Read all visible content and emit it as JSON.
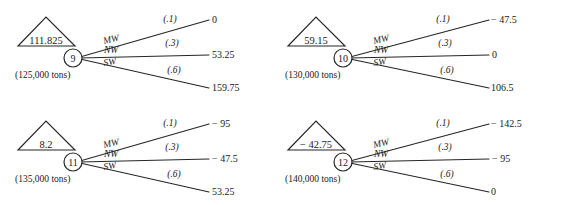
{
  "figure": {
    "type": "decision-tree-fragment",
    "panel_count": 4,
    "line_color": "#262626",
    "text_color": "#1a1a1a",
    "background_color": "#ffffff"
  },
  "panels": [
    {
      "id": "panel-9",
      "node_number": "9",
      "triangle_value": "111.825",
      "tons_label": "(125,000 tons)",
      "branches": [
        {
          "label": "MW",
          "probability": "(.1)",
          "payoff": "0"
        },
        {
          "label": "NW",
          "probability": "(.3)",
          "payoff": "53.25"
        },
        {
          "label": "SW",
          "probability": "(.6)",
          "payoff": "159.75"
        }
      ]
    },
    {
      "id": "panel-10",
      "node_number": "10",
      "triangle_value": "59.15",
      "tons_label": "(130,000 tons)",
      "branches": [
        {
          "label": "MW",
          "probability": "(.1)",
          "payoff": "− 47.5"
        },
        {
          "label": "NW",
          "probability": "(.3)",
          "payoff": "0"
        },
        {
          "label": "SW",
          "probability": "(.6)",
          "payoff": "106.5"
        }
      ]
    },
    {
      "id": "panel-11",
      "node_number": "11",
      "triangle_value": "8.2",
      "tons_label": "(135,000 tons)",
      "branches": [
        {
          "label": "MW",
          "probability": "(.1)",
          "payoff": "− 95"
        },
        {
          "label": "NW",
          "probability": "(.3)",
          "payoff": "− 47.5"
        },
        {
          "label": "SW",
          "probability": "(.6)",
          "payoff": "53.25"
        }
      ]
    },
    {
      "id": "panel-12",
      "node_number": "12",
      "triangle_value": "− 42.75",
      "tons_label": "(140,000 tons)",
      "branches": [
        {
          "label": "MW",
          "probability": "(.1)",
          "payoff": "− 142.5"
        },
        {
          "label": "NW",
          "probability": "(.3)",
          "payoff": "− 95"
        },
        {
          "label": "SW",
          "probability": "(.6)",
          "payoff": "0"
        }
      ]
    }
  ]
}
